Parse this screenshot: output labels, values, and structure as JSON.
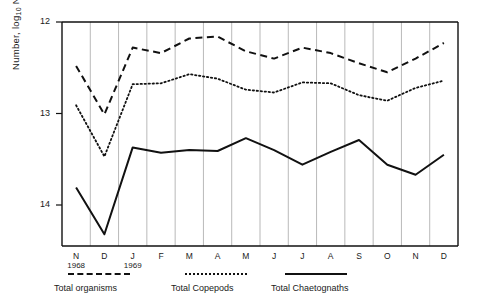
{
  "axes": {
    "y_title_main": "Number, log",
    "y_title_sub": "10",
    "y_title_tail": " N",
    "y_ticks": [
      "14",
      "13",
      "12"
    ],
    "x_ticks": [
      "N",
      "D",
      "J",
      "F",
      "M",
      "A",
      "M",
      "J",
      "J",
      "A",
      "S",
      "O",
      "N",
      "D"
    ],
    "year_left": "1968",
    "year_right": "1969"
  },
  "legend": [
    {
      "label": "Total organisms",
      "style": "dashed",
      "color": "#111111"
    },
    {
      "label": "Total Copepods",
      "style": "dotted",
      "color": "#111111"
    },
    {
      "label": "Total Chaetognaths",
      "style": "solid",
      "color": "#111111"
    }
  ],
  "chart_data": {
    "type": "line",
    "title": "",
    "xlabel": "",
    "ylabel": "Number, log10 N",
    "ylim": [
      11.6,
      14.0
    ],
    "yticks": [
      12,
      13,
      14
    ],
    "grid": true,
    "legend_position": "below-axis",
    "categories": [
      "N 1968",
      "D 1968",
      "J 1969",
      "F",
      "M",
      "A",
      "M",
      "J",
      "J",
      "A",
      "S",
      "O",
      "N",
      "D"
    ],
    "series": [
      {
        "name": "Total organisms",
        "style": "dashed",
        "values": [
          13.52,
          12.99,
          13.72,
          13.66,
          13.82,
          13.84,
          13.68,
          13.6,
          13.72,
          13.66,
          13.55,
          13.45,
          13.6,
          13.77
        ]
      },
      {
        "name": "Total Copepods",
        "style": "dotted",
        "values": [
          13.09,
          12.53,
          13.32,
          13.33,
          13.43,
          13.38,
          13.26,
          13.23,
          13.34,
          13.33,
          13.2,
          13.14,
          13.28,
          13.36
        ]
      },
      {
        "name": "Total Chaetognaths",
        "style": "solid",
        "values": [
          12.19,
          11.68,
          12.63,
          12.57,
          12.6,
          12.59,
          12.73,
          12.6,
          12.44,
          12.58,
          12.71,
          12.44,
          12.33,
          12.55
        ]
      }
    ]
  }
}
